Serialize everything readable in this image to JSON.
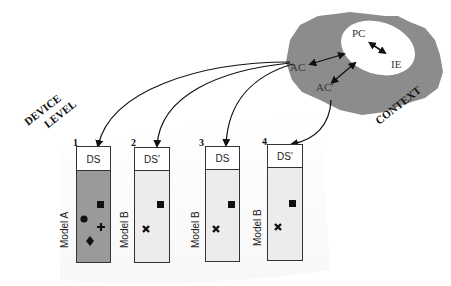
{
  "context": {
    "label": "CONTEXT",
    "nodes": {
      "pc": "PC",
      "ie": "IE",
      "ac": "AC",
      "ac_prime": "AC'"
    },
    "colors": {
      "cloud": "#8c8c8c",
      "inner": "#ffffff"
    }
  },
  "device_level": {
    "label_line1": "DEVICE",
    "label_line2": "LEVEL"
  },
  "devices": [
    {
      "number": "1",
      "ds": "DS",
      "model": "Model A",
      "fill": "#9a9a9a",
      "symbols": [
        "square",
        "circle",
        "plus",
        "diamond"
      ]
    },
    {
      "number": "2",
      "ds": "DS’",
      "model": "Model B",
      "fill": "#ececec",
      "symbols": [
        "square",
        "cross"
      ]
    },
    {
      "number": "3",
      "ds": "DS",
      "model": "Model B",
      "fill": "#ececec",
      "symbols": [
        "square",
        "cross"
      ]
    },
    {
      "number": "4",
      "ds": "DS’",
      "model": "Model B",
      "fill": "#ececec",
      "symbols": [
        "square",
        "cross"
      ]
    }
  ]
}
